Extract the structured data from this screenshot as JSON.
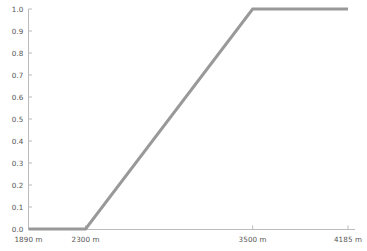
{
  "chart_data": {
    "type": "line",
    "title": "",
    "subtitle": "",
    "xlabel": "",
    "ylabel": "",
    "x": [
      1890,
      2300,
      3500,
      4185
    ],
    "values": [
      0.0,
      0.0,
      1.0,
      1.0
    ],
    "series": [
      {
        "name": "membership",
        "x": [
          1890,
          2300,
          3500,
          4185
        ],
        "values": [
          0.0,
          0.0,
          1.0,
          1.0
        ]
      }
    ],
    "xlim": [
      1890,
      4185
    ],
    "ylim": [
      0.0,
      1.0
    ],
    "x_tick_values": [
      1890,
      2300,
      3500,
      4185
    ],
    "x_tick_labels": [
      "1890 m",
      "2300 m",
      "3500 m",
      "4185 m"
    ],
    "y_tick_values": [
      0.0,
      0.1,
      0.2,
      0.3,
      0.4,
      0.5,
      0.6,
      0.7,
      0.8,
      0.9,
      1.0
    ],
    "y_tick_labels": [
      "0.0",
      "0.1",
      "0.2",
      "0.3",
      "0.4",
      "0.5",
      "0.6",
      "0.7",
      "0.8",
      "0.9",
      "1.0"
    ],
    "grid": false,
    "legend": false,
    "legend_position": "none",
    "annotations": [],
    "line_color": "#999999",
    "axis_color": "#bbbbbb",
    "tick_label_color": "#555555",
    "background_color": "#ffffff",
    "line_width": 3
  },
  "axes": {
    "y_ticks": [
      {
        "label": "1.0",
        "value": 1.0
      },
      {
        "label": "0.9",
        "value": 0.9
      },
      {
        "label": "0.8",
        "value": 0.8
      },
      {
        "label": "0.7",
        "value": 0.7
      },
      {
        "label": "0.6",
        "value": 0.6
      },
      {
        "label": "0.5",
        "value": 0.5
      },
      {
        "label": "0.4",
        "value": 0.4
      },
      {
        "label": "0.3",
        "value": 0.3
      },
      {
        "label": "0.2",
        "value": 0.2
      },
      {
        "label": "0.1",
        "value": 0.1
      },
      {
        "label": "0.0",
        "value": 0.0
      }
    ],
    "x_ticks": [
      {
        "label": "1890 m",
        "value": 1890
      },
      {
        "label": "2300 m",
        "value": 2300
      },
      {
        "label": "3500 m",
        "value": 3500
      },
      {
        "label": "4185 m",
        "value": 4185
      }
    ]
  }
}
